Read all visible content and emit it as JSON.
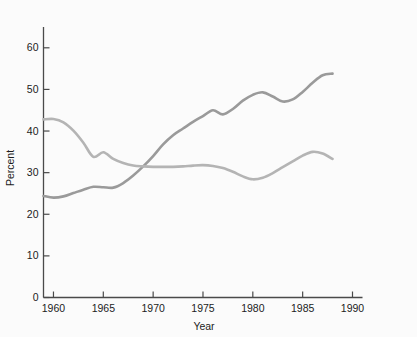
{
  "chart_data": {
    "type": "line",
    "title": "",
    "subtitle": "",
    "xlabel": "Year",
    "ylabel": "Percent",
    "xlim": [
      1959,
      1990
    ],
    "ylim": [
      0,
      65
    ],
    "xticks": [
      1960,
      1965,
      1970,
      1975,
      1980,
      1985,
      1990
    ],
    "xtick_labels": [
      "1960",
      "1965",
      "1970",
      "1975",
      "1980",
      "1985",
      "1990"
    ],
    "yticks": [
      0,
      10,
      20,
      30,
      40,
      50,
      60
    ],
    "ytick_labels": [
      "0",
      "10",
      "20",
      "30",
      "40",
      "50",
      "60"
    ],
    "grid": false,
    "legend": "none",
    "series": [
      {
        "name": "rising-series",
        "color": "#9a9a9a",
        "x": [
          1959,
          1960,
          1961,
          1962,
          1963,
          1964,
          1965,
          1966,
          1967,
          1968,
          1969,
          1970,
          1971,
          1972,
          1973,
          1974,
          1975,
          1976,
          1977,
          1978,
          1979,
          1980,
          1981,
          1982,
          1983,
          1984,
          1985,
          1986,
          1987,
          1988
        ],
        "values": [
          24.4,
          24.0,
          24.3,
          25.1,
          25.9,
          26.6,
          26.5,
          26.4,
          27.5,
          29.3,
          31.5,
          34.0,
          36.8,
          39.0,
          40.6,
          42.2,
          43.6,
          45.0,
          44.0,
          45.3,
          47.3,
          48.7,
          49.3,
          48.3,
          47.1,
          47.6,
          49.4,
          51.6,
          53.4,
          53.8
        ]
      },
      {
        "name": "declining-series",
        "color": "#b4b4b4",
        "x": [
          1959,
          1960,
          1961,
          1962,
          1963,
          1964,
          1965,
          1966,
          1967,
          1968,
          1969,
          1970,
          1971,
          1972,
          1973,
          1974,
          1975,
          1976,
          1977,
          1978,
          1979,
          1980,
          1981,
          1982,
          1983,
          1984,
          1985,
          1986,
          1987,
          1988
        ],
        "values": [
          42.8,
          42.9,
          42.1,
          40.1,
          37.2,
          33.8,
          34.9,
          33.3,
          32.3,
          31.7,
          31.5,
          31.4,
          31.4,
          31.4,
          31.5,
          31.7,
          31.8,
          31.6,
          31.1,
          30.2,
          29.1,
          28.4,
          28.8,
          29.9,
          31.3,
          32.7,
          34.1,
          35.0,
          34.6,
          33.3
        ]
      }
    ]
  },
  "axes": {
    "y_axis_label": "Percent",
    "x_axis_label": "Year"
  }
}
